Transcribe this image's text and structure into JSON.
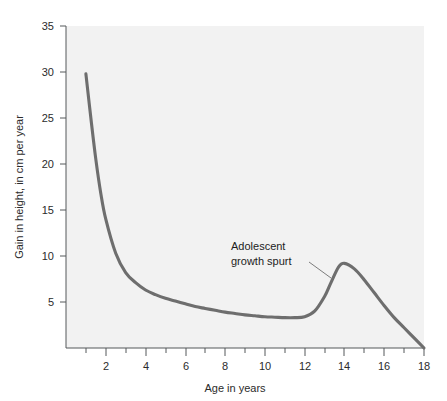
{
  "chart_data": {
    "type": "line",
    "title": "",
    "xlabel": "Age in years",
    "ylabel": "Gain in height, in cm per year",
    "xlim": [
      0,
      18
    ],
    "ylim": [
      0,
      35
    ],
    "grid": false,
    "legend": null,
    "x_ticks_major": [
      "2",
      "4",
      "6",
      "8",
      "10",
      "12",
      "14",
      "16",
      "18"
    ],
    "x_ticks_major_values": [
      2,
      4,
      6,
      8,
      10,
      12,
      14,
      16,
      18
    ],
    "x_ticks_minor_values": [
      1,
      3,
      5,
      7,
      9,
      11,
      13,
      15,
      17
    ],
    "y_ticks_major": [
      "5",
      "10",
      "15",
      "20",
      "25",
      "30",
      "35"
    ],
    "y_ticks_major_values": [
      5,
      10,
      15,
      20,
      25,
      30,
      35
    ],
    "annotations": [
      {
        "label_line1": "Adolescent",
        "label_line2": "growth spurt",
        "points_to_x": 13.0,
        "points_to_y": 6.6
      }
    ],
    "series": [
      {
        "name": "Growth velocity",
        "x": [
          1.0,
          1.25,
          1.5,
          1.75,
          2.0,
          2.5,
          3.0,
          3.5,
          4.0,
          4.5,
          5.0,
          5.5,
          6.0,
          6.5,
          7.0,
          7.5,
          8.0,
          8.5,
          9.0,
          9.5,
          10.0,
          10.5,
          11.0,
          11.5,
          12.0,
          12.5,
          13.0,
          13.3,
          13.7,
          14.0,
          14.5,
          15.0,
          15.5,
          16.0,
          16.5,
          17.0,
          17.5,
          18.0
        ],
        "y": [
          29.8,
          25.0,
          20.5,
          16.8,
          14.0,
          10.3,
          8.2,
          7.1,
          6.3,
          5.8,
          5.4,
          5.1,
          4.8,
          4.5,
          4.3,
          4.1,
          3.9,
          3.75,
          3.6,
          3.5,
          3.4,
          3.35,
          3.3,
          3.3,
          3.4,
          4.0,
          5.6,
          7.0,
          8.8,
          9.2,
          8.6,
          7.4,
          6.0,
          4.6,
          3.3,
          2.2,
          1.1,
          0.0
        ]
      }
    ],
    "colors": {
      "curve": "#6e6e6e",
      "plot_background": "#f2f2f2",
      "axis": "#55585a",
      "page_background": "#ffffff"
    }
  }
}
